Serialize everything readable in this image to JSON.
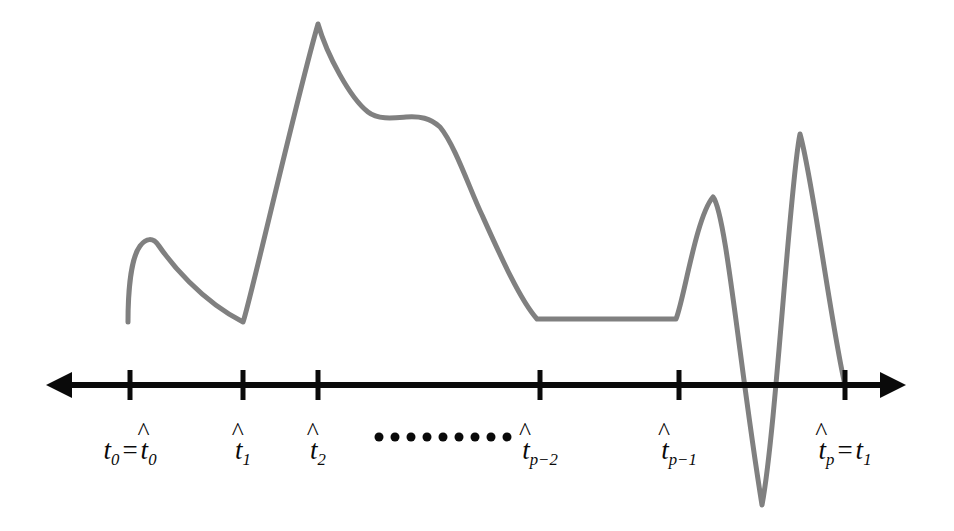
{
  "figure": {
    "background_color": "#ffffff",
    "axis_color": "#0a0a0a",
    "curve_color": "#808080",
    "width": 954,
    "height": 531
  },
  "axis": {
    "name": "time-axis",
    "y": 385,
    "left_arrow_tip_x": 46,
    "right_arrow_tip_x": 906,
    "line_width": 6,
    "arrow_head_length": 26,
    "arrow_head_half_height": 13,
    "tick_height": 30,
    "tick_width": 5
  },
  "ticks": [
    {
      "id": "t0",
      "x": 130,
      "label_html": "t0 = hat t0"
    },
    {
      "id": "t1hat",
      "x": 243,
      "label_html": "hat t1"
    },
    {
      "id": "t2hat",
      "x": 318,
      "label_html": "hat t2"
    },
    {
      "id": "tp-2hat",
      "x": 540,
      "label_html": "hat t p-2"
    },
    {
      "id": "tp-1hat",
      "x": 679,
      "label_html": "hat t p-1"
    },
    {
      "id": "tphat",
      "x": 845,
      "label_html": "hat tp = t1"
    }
  ],
  "labels": {
    "t0_main": "t",
    "t0_sub": "0",
    "t0_eq": "=",
    "t0_hat_var": "t",
    "t0_hat_sub": "0",
    "t1hat_var": "t",
    "t1hat_sub": "1",
    "t2hat_var": "t",
    "t2hat_sub": "2",
    "tp2hat_var": "t",
    "tp2hat_sub": "p−2",
    "tp1hat_var": "t",
    "tp1hat_sub": "p−1",
    "tphat_var": "t",
    "tphat_sub": "p",
    "tphat_eq": "=",
    "tphat_end_var": "t",
    "tphat_end_sub": "1",
    "hat_glyph": "^",
    "label_y": 437
  },
  "ellipsis": {
    "name": "axis-ellipsis",
    "center_x": 443,
    "center_y": 437,
    "dot_count": 9,
    "dot_diameter": 9
  },
  "chart_data": {
    "type": "line",
    "title": "",
    "xlabel": "",
    "ylabel": "",
    "grid": false,
    "legend": null,
    "curve_color": "#808080",
    "curve_width": 5,
    "axis_baseline_y": 385,
    "xlim": [
      46,
      906
    ],
    "ylim_pixels": [
      24,
      506
    ],
    "tick_positions": [
      130,
      243,
      318,
      540,
      679,
      845
    ],
    "tick_labels": [
      "t0 = t̂0",
      "t̂1",
      "t̂2",
      "t̂p−2",
      "t̂p−1",
      "t̂p = t1"
    ],
    "annotations": [
      "ellipsis between t̂2 and t̂p−2"
    ],
    "key_points": [
      {
        "x": 128,
        "y": 322,
        "kind": "start"
      },
      {
        "x": 152,
        "y": 240,
        "kind": "local-max"
      },
      {
        "x": 243,
        "y": 322,
        "kind": "local-min"
      },
      {
        "x": 318,
        "y": 24,
        "kind": "global-max"
      },
      {
        "x": 405,
        "y": 117,
        "kind": "shoulder"
      },
      {
        "x": 440,
        "y": 124,
        "kind": "inflection"
      },
      {
        "x": 537,
        "y": 319,
        "kind": "plateau-start"
      },
      {
        "x": 676,
        "y": 319,
        "kind": "plateau-end"
      },
      {
        "x": 713,
        "y": 197,
        "kind": "local-max"
      },
      {
        "x": 762,
        "y": 505,
        "kind": "global-min"
      },
      {
        "x": 800,
        "y": 134,
        "kind": "local-max"
      },
      {
        "x": 845,
        "y": 385,
        "kind": "end-on-axis"
      }
    ],
    "path": "M128,322 C128,292 131,258 140,246 C146,238 153,237 159,246 C170,262 200,300 243,322 C248,311 296,100 318,24 C327,55 350,98 368,112 C378,120 394,118 406,117 C420,116 430,118 440,127 C455,145 470,190 482,215 C500,255 520,300 537,319 L676,319 C684,300 696,217 713,197 C726,212 740,370 762,505 C776,430 790,180 800,134 C812,175 832,330 845,385"
  }
}
